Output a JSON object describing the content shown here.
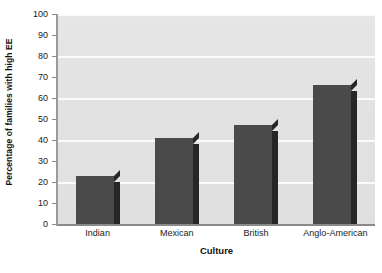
{
  "chart_data": {
    "type": "bar",
    "title": "",
    "subtitle": "",
    "categories": [
      "Indian",
      "Mexican",
      "British",
      "Anglo-American"
    ],
    "values": [
      23,
      41,
      47,
      66
    ],
    "xlabel": "Culture",
    "ylabel": "Percentage of families with high EE",
    "ylim": [
      0,
      100
    ],
    "ytick_labels": [
      "0",
      "10",
      "20",
      "30",
      "40",
      "50",
      "60",
      "70",
      "80",
      "90",
      "100"
    ],
    "ytick_values": [
      0,
      10,
      20,
      30,
      40,
      50,
      60,
      70,
      80,
      90,
      100
    ],
    "gridlines": {
      "enabled": true,
      "axis": "y",
      "values": [
        20,
        40,
        60,
        80,
        100
      ],
      "color": "#fbfbfb"
    },
    "legend": {
      "visible": false,
      "position": "none",
      "entries": []
    },
    "series": [
      {
        "name": "Percentage of families with high EE",
        "values": [
          23,
          41,
          47,
          66
        ],
        "color": "#4a4a4a",
        "edge_color": "#262626"
      }
    ],
    "style": {
      "plot_background": "#e3e3e3",
      "figure_background": "#ffffff",
      "axis_color": "#8a8a8a",
      "text_color": "#1a1a1a",
      "bar_3d": true
    }
  }
}
